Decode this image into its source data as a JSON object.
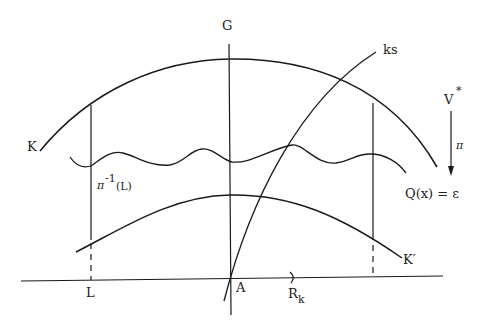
{
  "diagram": {
    "type": "geometric-schematic",
    "labels": {
      "G": "G",
      "ks": "ks",
      "V": "V",
      "V_sup": "*",
      "pi": "π",
      "K": "K",
      "pi_inv_base": "π",
      "pi_inv_sup": "-1",
      "pi_inv_arg": "(L)",
      "Q": "Q(x) = ε",
      "K_prime": "K′",
      "L": "L",
      "A": "A",
      "R": "R",
      "R_sub": "k"
    },
    "elements": [
      {
        "id": "K",
        "kind": "arc",
        "desc": "upper arc K"
      },
      {
        "id": "K_prime",
        "kind": "arc",
        "desc": "lower arc K′"
      },
      {
        "id": "level_set",
        "kind": "wavy-curve",
        "desc": "Q(x) = ε"
      },
      {
        "id": "G",
        "kind": "vertical-axis",
        "desc": "vertical line through A"
      },
      {
        "id": "ks",
        "kind": "curve",
        "desc": "curve ks through A"
      },
      {
        "id": "R_k",
        "kind": "horizontal-axis",
        "desc": "horizontal line with marker R_k"
      },
      {
        "id": "fiber_L",
        "kind": "vertical-segment",
        "desc": "π^-1(L) fiber over L"
      },
      {
        "id": "fiber_right",
        "kind": "vertical-segment",
        "desc": "fiber over right point"
      },
      {
        "id": "projection",
        "kind": "arrow",
        "desc": "π : V* downward"
      }
    ],
    "colors": {
      "ink": "#1a1a1a",
      "background": "#ffffff"
    }
  }
}
